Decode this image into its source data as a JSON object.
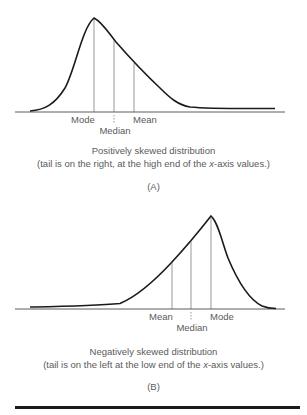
{
  "panels": [
    {
      "id": "A",
      "id_label": "(A)",
      "title": "Positively skewed distribution",
      "subtitle_before": "(tail is on the right, at the high end of the ",
      "subtitle_italic": "x",
      "subtitle_after": "-axis values.)",
      "markers": {
        "mode": "Mode",
        "median": "Median",
        "mean": "Mean"
      },
      "order_left_to_right": [
        "Mode",
        "Median",
        "Mean"
      ],
      "skew": "positive"
    },
    {
      "id": "B",
      "id_label": "(B)",
      "title": "Negatively skewed distribution",
      "subtitle_before": "(tail is on the left at the low end of the ",
      "subtitle_italic": "x",
      "subtitle_after": "-axis values.)",
      "markers": {
        "mean": "Mean",
        "median": "Median",
        "mode": "Mode"
      },
      "order_left_to_right": [
        "Mean",
        "Median",
        "Mode"
      ],
      "skew": "negative"
    }
  ],
  "colors": {
    "curve": "#1a1a1a",
    "axis": "#333333",
    "marker_lines": "#555555",
    "text": "#5a5a5a"
  }
}
